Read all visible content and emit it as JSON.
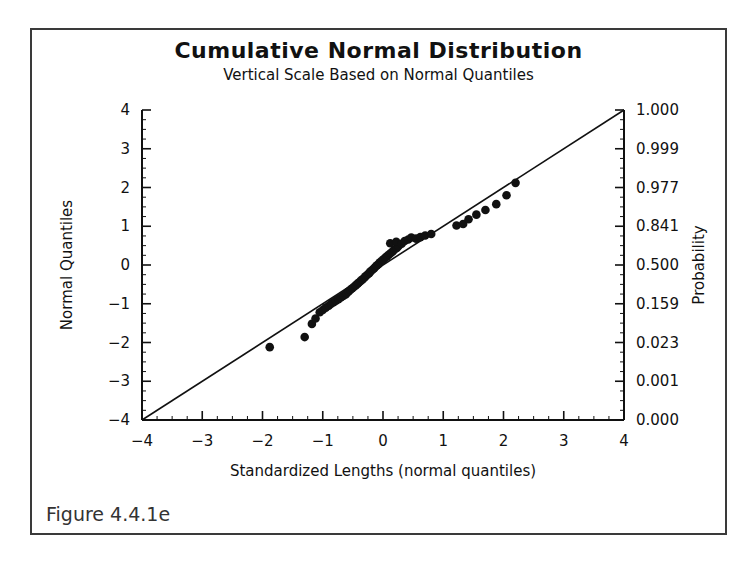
{
  "figure": {
    "caption": "Figure 4.4.1e",
    "title": "Cumulative Normal Distribution",
    "subtitle": "Vertical Scale Based on Normal Quantiles"
  },
  "chart_data": {
    "type": "scatter",
    "title": "Cumulative Normal Distribution",
    "subtitle": "Vertical Scale Based on Normal Quantiles",
    "xlabel": "Standardized Lengths (normal quantiles)",
    "ylabel": "Normal Quantiles",
    "y2label": "Probability",
    "xlim": [
      -4,
      4
    ],
    "ylim": [
      -4,
      4
    ],
    "grid": false,
    "legend": null,
    "xticks": [
      -4,
      -3,
      -2,
      -1,
      0,
      1,
      2,
      3,
      4
    ],
    "xticklabels": [
      "-4",
      "-3",
      "-2",
      "-1",
      "0",
      "1",
      "2",
      "3",
      "4"
    ],
    "yticks": [
      -4,
      -3,
      -2,
      -1,
      0,
      1,
      2,
      3,
      4
    ],
    "yticklabels": [
      "-4",
      "-3",
      "-2",
      "-1",
      "0",
      "1",
      "2",
      "3",
      "4"
    ],
    "y2ticks": [
      4,
      3,
      2,
      1,
      0,
      -1,
      -2,
      -3,
      -4
    ],
    "y2ticklabels": [
      "1.000",
      "0.999",
      "0.977",
      "0.841",
      "0.500",
      "0.159",
      "0.023",
      "0.001",
      "0.000"
    ],
    "minor_tick_interval": 0.25,
    "reference_line": {
      "name": "identity line",
      "x": [
        -4,
        4
      ],
      "y": [
        -4,
        4
      ],
      "color": "#111111"
    },
    "series": [
      {
        "name": "Standardized lengths",
        "marker": "filled-circle",
        "color": "#111111",
        "points": [
          [
            -1.88,
            -2.12
          ],
          [
            -1.3,
            -1.86
          ],
          [
            -1.18,
            -1.52
          ],
          [
            -1.12,
            -1.38
          ],
          [
            -1.05,
            -1.22
          ],
          [
            -1.0,
            -1.16
          ],
          [
            -0.95,
            -1.1
          ],
          [
            -0.9,
            -1.05
          ],
          [
            -0.86,
            -1.0
          ],
          [
            -0.82,
            -0.96
          ],
          [
            -0.78,
            -0.92
          ],
          [
            -0.74,
            -0.88
          ],
          [
            -0.7,
            -0.84
          ],
          [
            -0.66,
            -0.8
          ],
          [
            -0.62,
            -0.76
          ],
          [
            -0.6,
            -0.72
          ],
          [
            -0.57,
            -0.68
          ],
          [
            -0.54,
            -0.64
          ],
          [
            -0.51,
            -0.6
          ],
          [
            -0.48,
            -0.56
          ],
          [
            -0.45,
            -0.52
          ],
          [
            -0.42,
            -0.48
          ],
          [
            -0.4,
            -0.45
          ],
          [
            -0.37,
            -0.41
          ],
          [
            -0.34,
            -0.37
          ],
          [
            -0.31,
            -0.33
          ],
          [
            -0.29,
            -0.29
          ],
          [
            -0.26,
            -0.25
          ],
          [
            -0.23,
            -0.21
          ],
          [
            -0.21,
            -0.17
          ],
          [
            -0.18,
            -0.13
          ],
          [
            -0.15,
            -0.09
          ],
          [
            -0.13,
            -0.05
          ],
          [
            -0.1,
            -0.01
          ],
          [
            -0.07,
            0.03
          ],
          [
            -0.05,
            0.07
          ],
          [
            -0.02,
            0.11
          ],
          [
            0.01,
            0.15
          ],
          [
            0.04,
            0.19
          ],
          [
            0.07,
            0.23
          ],
          [
            0.1,
            0.27
          ],
          [
            0.13,
            0.31
          ],
          [
            0.16,
            0.35
          ],
          [
            0.19,
            0.4
          ],
          [
            0.23,
            0.44
          ],
          [
            0.26,
            0.49
          ],
          [
            0.12,
            0.56
          ],
          [
            0.22,
            0.6
          ],
          [
            0.31,
            0.55
          ],
          [
            0.36,
            0.62
          ],
          [
            0.42,
            0.66
          ],
          [
            0.47,
            0.71
          ],
          [
            0.55,
            0.68
          ],
          [
            0.62,
            0.72
          ],
          [
            0.7,
            0.76
          ],
          [
            0.8,
            0.8
          ],
          [
            1.22,
            1.02
          ],
          [
            1.33,
            1.06
          ],
          [
            1.42,
            1.18
          ],
          [
            1.55,
            1.3
          ],
          [
            1.7,
            1.42
          ],
          [
            1.88,
            1.57
          ],
          [
            2.05,
            1.8
          ],
          [
            2.2,
            2.12
          ]
        ]
      }
    ]
  }
}
